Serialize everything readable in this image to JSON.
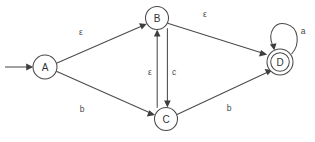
{
  "diagram": {
    "type": "finite-automaton-state-diagram",
    "canvas": {
      "width": 315,
      "height": 142,
      "background": "#ffffff"
    },
    "colors": {
      "stroke": "#4a4a4a",
      "arrow": "#3f3f3f",
      "text": "#333333",
      "background": "#ffffff"
    },
    "start_marker": {
      "name": "start-arrow",
      "from_x": 5,
      "to_x": 32,
      "y": 67,
      "target_state": "A"
    },
    "states": [
      {
        "id": "A",
        "label": "A",
        "cx": 45,
        "cy": 67,
        "r": 12,
        "accepting": false,
        "start": true
      },
      {
        "id": "B",
        "label": "B",
        "cx": 157,
        "cy": 18,
        "r": 11.5,
        "accepting": false,
        "start": false
      },
      {
        "id": "C",
        "label": "C",
        "cx": 166,
        "cy": 119,
        "r": 11.5,
        "accepting": false,
        "start": false
      },
      {
        "id": "D",
        "label": "D",
        "cx": 280,
        "cy": 62,
        "r": 13,
        "r_inner": 9.3,
        "accepting": true,
        "start": false
      }
    ],
    "transitions": [
      {
        "id": "A-B",
        "from": "A",
        "to": "B",
        "label": "ε",
        "label_x": 81,
        "label_y": 32,
        "kind": "straight"
      },
      {
        "id": "B-D",
        "from": "B",
        "to": "D",
        "label": "ε",
        "label_x": 205,
        "label_y": 14,
        "kind": "straight"
      },
      {
        "id": "A-C",
        "from": "A",
        "to": "C",
        "label": "b",
        "label_x": 82,
        "label_y": 109,
        "kind": "straight"
      },
      {
        "id": "C-D",
        "from": "C",
        "to": "D",
        "label": "b",
        "label_x": 229,
        "label_y": 108,
        "kind": "straight"
      },
      {
        "id": "C-B",
        "from": "C",
        "to": "B",
        "label": "ε",
        "label_x": 150,
        "label_y": 72,
        "kind": "vertical-up"
      },
      {
        "id": "B-C",
        "from": "B",
        "to": "C",
        "label": "c",
        "label_x": 174,
        "label_y": 72,
        "kind": "vertical-down"
      },
      {
        "id": "D-D",
        "from": "D",
        "to": "D",
        "label": "a",
        "label_x": 303,
        "label_y": 31,
        "kind": "self-loop"
      }
    ]
  }
}
